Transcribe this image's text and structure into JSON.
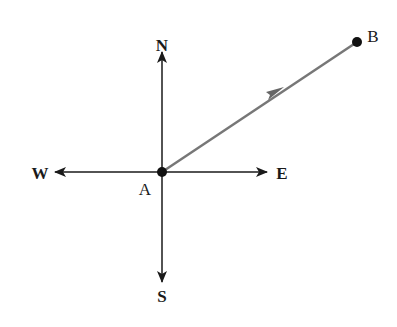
{
  "diagram": {
    "title": "",
    "directions": {
      "north": "N",
      "south": "S",
      "east": "E",
      "west": "W"
    },
    "points": {
      "origin": "A",
      "target": "B"
    },
    "colors": {
      "axes": "#1a1a1a",
      "vector": "#777777",
      "points": "#111111"
    }
  }
}
